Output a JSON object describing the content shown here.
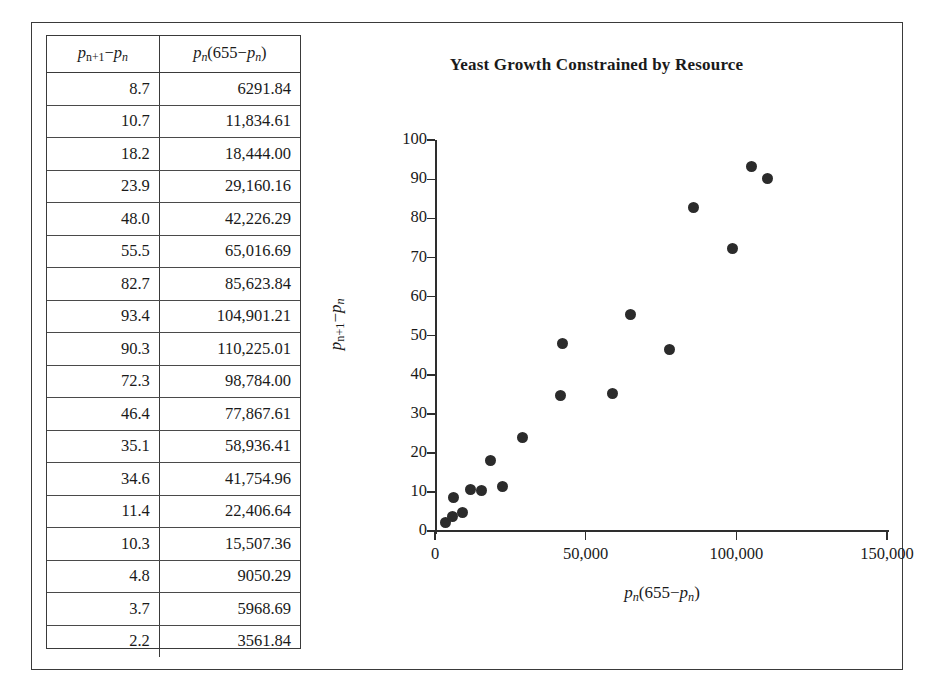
{
  "figure": {
    "background_color": "#ffffff",
    "border_color": "#3a3a3a"
  },
  "table": {
    "headers": {
      "col_a_plain": "p_{n+1} - p_n",
      "col_b_plain": "p_n(655 - p_n)"
    },
    "rows": [
      {
        "delta": "8.7",
        "product": "6291.84"
      },
      {
        "delta": "10.7",
        "product": "11,834.61"
      },
      {
        "delta": "18.2",
        "product": "18,444.00"
      },
      {
        "delta": "23.9",
        "product": "29,160.16"
      },
      {
        "delta": "48.0",
        "product": "42,226.29"
      },
      {
        "delta": "55.5",
        "product": "65,016.69"
      },
      {
        "delta": "82.7",
        "product": "85,623.84"
      },
      {
        "delta": "93.4",
        "product": "104,901.21"
      },
      {
        "delta": "90.3",
        "product": "110,225.01"
      },
      {
        "delta": "72.3",
        "product": "98,784.00"
      },
      {
        "delta": "46.4",
        "product": "77,867.61"
      },
      {
        "delta": "35.1",
        "product": "58,936.41"
      },
      {
        "delta": "34.6",
        "product": "41,754.96"
      },
      {
        "delta": "11.4",
        "product": "22,406.64"
      },
      {
        "delta": "10.3",
        "product": "15,507.36"
      },
      {
        "delta": "4.8",
        "product": "9050.29"
      },
      {
        "delta": "3.7",
        "product": "5968.69"
      },
      {
        "delta": "2.2",
        "product": "3561.84"
      }
    ]
  },
  "chart_data": {
    "type": "scatter",
    "title": "Yeast Growth Constrained by Resource",
    "xlabel": "p_n(655 - p_n)",
    "ylabel": "p_{n+1} - p_n",
    "xlim": [
      0,
      150000
    ],
    "ylim": [
      0,
      100
    ],
    "xticks": [
      0,
      50000,
      100000,
      150000
    ],
    "xtick_labels": [
      "0",
      "50,000",
      "100,000",
      "150,000"
    ],
    "yticks": [
      0,
      10,
      20,
      30,
      40,
      50,
      60,
      70,
      80,
      90,
      100
    ],
    "ytick_labels": [
      "0",
      "10",
      "20",
      "30",
      "40",
      "50",
      "60",
      "70",
      "80",
      "90",
      "100"
    ],
    "grid": false,
    "legend": null,
    "marker_color": "#2b2b2b",
    "points": [
      {
        "x": 3561.84,
        "y": 2.2
      },
      {
        "x": 5968.69,
        "y": 3.7
      },
      {
        "x": 6291.84,
        "y": 8.7
      },
      {
        "x": 9050.29,
        "y": 4.8
      },
      {
        "x": 11834.61,
        "y": 10.7
      },
      {
        "x": 15507.36,
        "y": 10.3
      },
      {
        "x": 18444.0,
        "y": 18.2
      },
      {
        "x": 22406.64,
        "y": 11.4
      },
      {
        "x": 29160.16,
        "y": 23.9
      },
      {
        "x": 41754.96,
        "y": 34.6
      },
      {
        "x": 42226.29,
        "y": 48.0
      },
      {
        "x": 58936.41,
        "y": 35.1
      },
      {
        "x": 65016.69,
        "y": 55.5
      },
      {
        "x": 77867.61,
        "y": 46.4
      },
      {
        "x": 85623.84,
        "y": 82.7
      },
      {
        "x": 98784.0,
        "y": 72.3
      },
      {
        "x": 104901.21,
        "y": 93.4
      },
      {
        "x": 110225.01,
        "y": 90.3
      }
    ]
  }
}
